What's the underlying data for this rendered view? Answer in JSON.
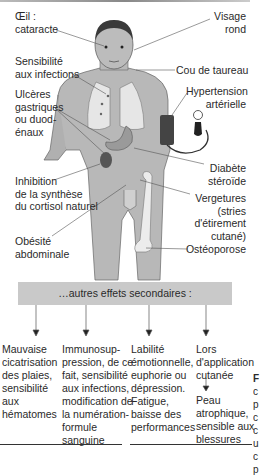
{
  "labels": {
    "eye": "Œil :\ncataracte",
    "eye_l1": "Œil :",
    "eye_l2": "cataracte",
    "face_l1": "Visage",
    "face_l2": "rond",
    "infect_l1": "Sensibilité",
    "infect_l2": "aux infections",
    "neck": "Cou de taureau",
    "ulcer_l1": "Ulcères",
    "ulcer_l2": "gastriques",
    "ulcer_l3": "ou duod-",
    "ulcer_l4": "énaux",
    "htn_l1": "Hypertension",
    "htn_l2": "artérielle",
    "diab_l1": "Diabète",
    "diab_l2": "stéroïde",
    "inhib_l1": "Inhibition",
    "inhib_l2": "de la synthèse",
    "inhib_l3": "du cortisol naturel",
    "verg_l1": "Vergetures",
    "verg_l2": "(stries",
    "verg_l3": "d'étirement",
    "verg_l4": "cutané)",
    "obes_l1": "Obésité",
    "obes_l2": "abdominale",
    "osteo": "Ostéoporose"
  },
  "box": {
    "title": "…autres effets secondaires :"
  },
  "columns": [
    {
      "lines": [
        "Mauvaise",
        "cicatrisation",
        "des plaies,",
        "sensibilité",
        "aux",
        "hématomes"
      ]
    },
    {
      "lines": [
        "Immunosup-",
        "pression, de ce",
        "fait, sensibilité",
        "aux infections,",
        "modification de",
        "la numération-",
        "formule",
        "sanguine"
      ]
    },
    {
      "lines": [
        "Labilité",
        "émotionnelle,",
        "euphorie ou",
        "dépression.",
        "Fatigue,",
        "baisse des",
        "performances"
      ]
    },
    {
      "lines": [
        "Lors",
        "d'application",
        "cutanée"
      ]
    }
  ],
  "sub": {
    "lines": [
      "Peau",
      "atrophique,",
      "sensible aux",
      "blessures"
    ]
  },
  "caption": {
    "lines": [
      "F",
      "c",
      "p",
      "c",
      "c",
      "u",
      "c",
      "p"
    ]
  },
  "colors": {
    "body": "#b8b8b8",
    "organ": "#e6e6e6",
    "dark": "#555555",
    "box": "#c9c9c9"
  }
}
